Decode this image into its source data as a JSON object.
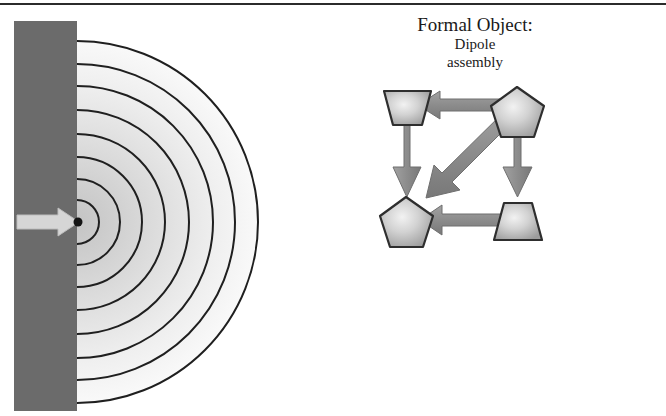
{
  "page": {
    "width": 666,
    "height": 416,
    "background_color": "#ffffff",
    "top_rule_color": "#2b2b2b"
  },
  "caption": {
    "line1": "Formal Object:",
    "line2": "Dipole",
    "line3": "assembly"
  },
  "wave_figure": {
    "name": "point-source-wavefront-diagram",
    "barrier": {
      "label": "barrier-wall",
      "color": "#6b6b6b",
      "x": 14,
      "y": 21,
      "width": 62,
      "height": 390
    },
    "source_point": {
      "label": "point-source",
      "color": "#1a1a1a",
      "x": 77,
      "y": 222,
      "radius": 4
    },
    "incoming_arrow": {
      "label": "incoming-ray-arrow",
      "direction": "right",
      "color": "#d0d0d0",
      "outline_color": "#b5b5b5",
      "from_x": 17,
      "to_x": 77,
      "y": 222
    },
    "wavefronts": {
      "label": "concentric-wavefront-arcs",
      "count": 8,
      "stroke_color": "#1f1f1f",
      "stroke_width": 2,
      "center_x": 77,
      "center_y": 222,
      "radii": [
        22,
        43,
        65,
        88,
        112,
        136,
        158,
        181
      ],
      "fill_light": "#f5f5f5",
      "fill_dark": "#c9c9c9"
    }
  },
  "formal_diagram": {
    "name": "dipole-assembly-graph",
    "node_fill_center": "#f0f0f0",
    "node_fill_edge": "#9a9a9a",
    "node_stroke": "#2e2e2e",
    "arrow_color": "#8e8e8e",
    "arrow_stroke": "#6e6e6e",
    "nodes": [
      {
        "id": "top-left",
        "shape": "trapezoid-down",
        "x": 48,
        "y": 28
      },
      {
        "id": "top-right",
        "shape": "pentagon",
        "x": 158,
        "y": 26
      },
      {
        "id": "bottom-left",
        "shape": "pentagon",
        "x": 46,
        "y": 142
      },
      {
        "id": "bottom-right",
        "shape": "trapezoid-up",
        "x": 158,
        "y": 142
      }
    ],
    "edges": [
      {
        "id": "edge-top",
        "from": "top-right",
        "to": "top-left",
        "orientation": "horizontal",
        "direction": "left"
      },
      {
        "id": "edge-left",
        "from": "top-left",
        "to": "bottom-left",
        "orientation": "vertical",
        "direction": "down"
      },
      {
        "id": "edge-right",
        "from": "top-right",
        "to": "bottom-right",
        "orientation": "vertical",
        "direction": "down"
      },
      {
        "id": "edge-bottom",
        "from": "bottom-right",
        "to": "bottom-left",
        "orientation": "horizontal",
        "direction": "left"
      },
      {
        "id": "edge-diagonal",
        "from": "top-right",
        "to": "bottom-left",
        "orientation": "diagonal",
        "direction": "down-left"
      }
    ]
  }
}
